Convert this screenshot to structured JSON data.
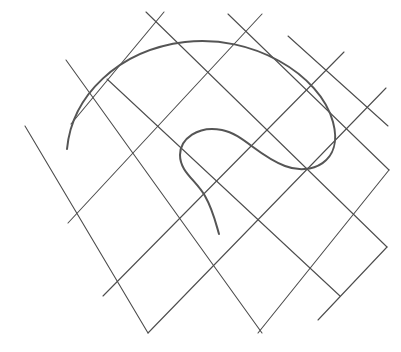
{
  "canvas": {
    "width": 401,
    "height": 352,
    "background_color": "#ffffff"
  },
  "diagram": {
    "title": "",
    "grid": {
      "line_color": "#4d4d4d",
      "line_width": 1.1,
      "family_a_name": "down-right-diagonals",
      "family_b_name": "down-left-diagonals",
      "segments_family_a": [
        {
          "x1": 25,
          "y1": 126,
          "x2": 148,
          "y2": 333
        },
        {
          "x1": 66,
          "y1": 60,
          "x2": 262,
          "y2": 333
        },
        {
          "x1": 107,
          "y1": 79,
          "x2": 340,
          "y2": 296
        },
        {
          "x1": 146,
          "y1": 12,
          "x2": 387,
          "y2": 247
        },
        {
          "x1": 228,
          "y1": 14,
          "x2": 389,
          "y2": 170
        },
        {
          "x1": 288,
          "y1": 36,
          "x2": 388,
          "y2": 126
        }
      ],
      "segments_family_b": [
        {
          "x1": 164,
          "y1": 12,
          "x2": 71,
          "y2": 124
        },
        {
          "x1": 262,
          "y1": 14,
          "x2": 68,
          "y2": 223
        },
        {
          "x1": 344,
          "y1": 52,
          "x2": 103,
          "y2": 296
        },
        {
          "x1": 386,
          "y1": 88,
          "x2": 148,
          "y2": 333
        },
        {
          "x1": 389,
          "y1": 170,
          "x2": 258,
          "y2": 333
        },
        {
          "x1": 387,
          "y1": 247,
          "x2": 318,
          "y2": 320
        }
      ]
    },
    "curve": {
      "name": "spiral-curve",
      "stroke_color": "#555555",
      "stroke_width": 2.0,
      "start_point": {
        "x": 67,
        "y": 149
      },
      "end_point": {
        "x": 219,
        "y": 234
      },
      "path": "M 67 149 C 72 96 118 50 185 42 C 252 34 320 74 333 122 C 344 163 310 176 285 166 C 258 156 243 134 222 130 C 198 125 180 139 180 155 C 180 172 196 180 205 196 C 213 210 216 224 219 234"
    }
  }
}
